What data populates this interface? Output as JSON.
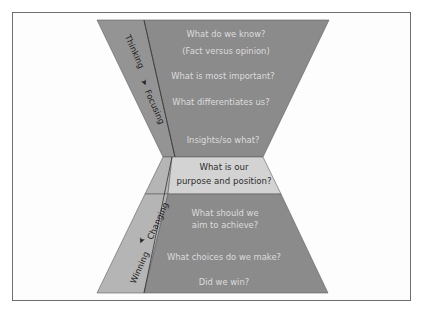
{
  "diagram": {
    "type": "hourglass",
    "colors": {
      "main_fill": "#8b8b8b",
      "upper_side_strip": "#949494",
      "lower_side_strip": "#b5b5b5",
      "center_band": "#d3d3d3",
      "question_text": "#dcdcdc",
      "center_text": "#2e2e2e",
      "border": "#6e6e6e"
    },
    "upper_side_labels": {
      "from": "Thinking",
      "to": "Focusing"
    },
    "lower_side_labels": {
      "from": "Changing",
      "to": "Winning"
    },
    "upper_questions": [
      "What do we know?",
      "(Fact versus opinion)",
      "What is most important?",
      "What differentiates us?",
      "Insights/so what?"
    ],
    "center": {
      "line1": "What is our",
      "line2": "purpose and position?"
    },
    "lower_questions": [
      "What should we",
      "aim to achieve?",
      "What choices do we make?",
      "Did we win?"
    ]
  }
}
